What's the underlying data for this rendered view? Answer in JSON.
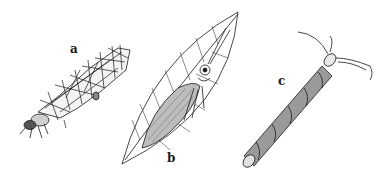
{
  "figure": {
    "panels": [
      {
        "id": "a",
        "label": "a",
        "subject": "caddisfly larva in stick/leaf-fragment case"
      },
      {
        "id": "b",
        "label": "b",
        "subject": "adult caddisfly resting on leaf"
      },
      {
        "id": "c",
        "label": "c",
        "subject": "caddisfly larva in spiral-wound tubular case"
      }
    ],
    "colors": {
      "ink": "#1a1a1a",
      "shade": "#8a8a8a",
      "background": "#ffffff"
    }
  }
}
